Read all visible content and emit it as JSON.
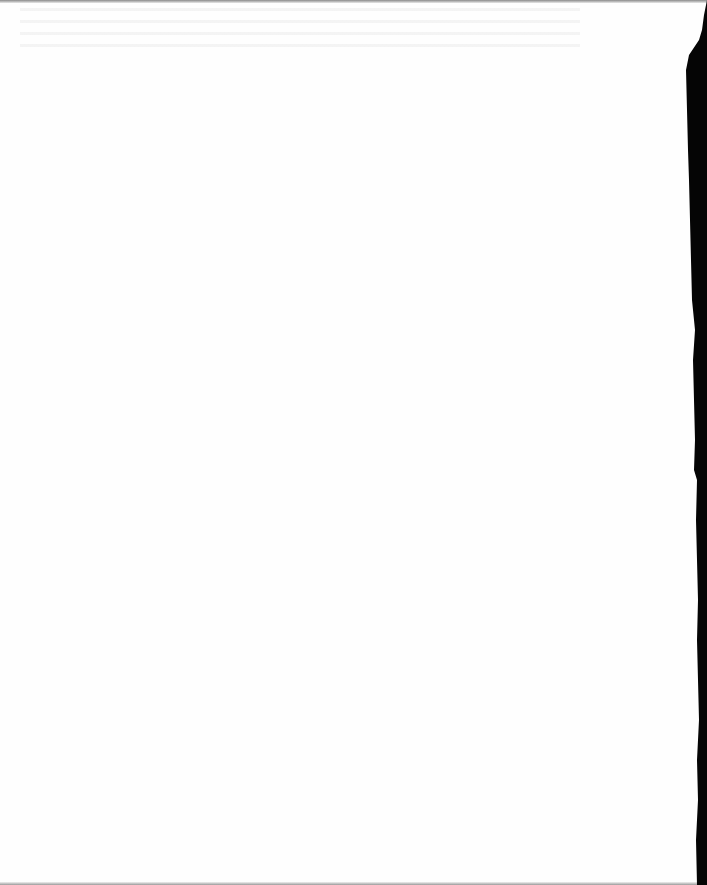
{
  "document": {
    "page_state": "blank scanned page",
    "visible_text": "",
    "colors": {
      "paper": "#fefefe",
      "edge_shadow": "#000000"
    }
  }
}
